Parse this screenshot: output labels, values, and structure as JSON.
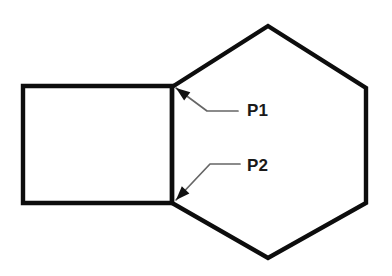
{
  "figure": {
    "background_color": "#ffffff",
    "shape_stroke_color": "#0d0d0d",
    "leader_color": "#666666",
    "label_color": "#1a1a1a",
    "shapes": [
      {
        "name": "rectangle",
        "kind": "rectangle",
        "stroke_width": 4.4,
        "vertices": [
          {
            "x": 23,
            "y": 86
          },
          {
            "x": 172,
            "y": 86
          },
          {
            "x": 172,
            "y": 203
          },
          {
            "x": 23,
            "y": 203
          }
        ]
      },
      {
        "name": "hexagon",
        "kind": "hexagon",
        "stroke_width": 4.4,
        "vertices": [
          {
            "x": 172,
            "y": 87
          },
          {
            "x": 268,
            "y": 26
          },
          {
            "x": 366,
            "y": 88
          },
          {
            "x": 366,
            "y": 203
          },
          {
            "x": 268,
            "y": 258
          },
          {
            "x": 172,
            "y": 203
          }
        ]
      }
    ],
    "annotations": [
      {
        "name": "p1",
        "label": "P1",
        "label_x": 247,
        "label_y": 116,
        "target_x": 176,
        "target_y": 88,
        "elbow_x": 207,
        "elbow_y": 111,
        "tail_x": 238,
        "tail_y": 111,
        "arrow_angle_deg": 215
      },
      {
        "name": "p2",
        "label": "P2",
        "label_x": 247,
        "label_y": 171,
        "target_x": 176,
        "target_y": 200,
        "elbow_x": 210,
        "elbow_y": 164,
        "tail_x": 240,
        "tail_y": 164,
        "arrow_angle_deg": 134
      }
    ]
  }
}
